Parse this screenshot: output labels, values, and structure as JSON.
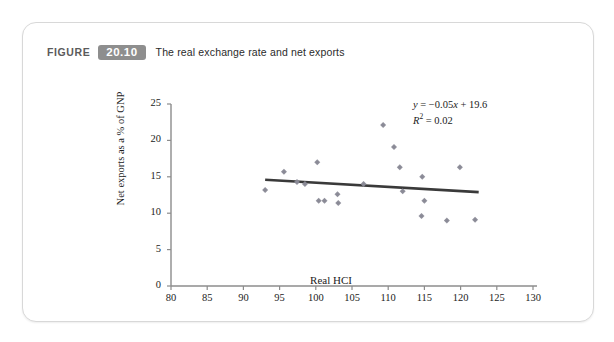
{
  "figure": {
    "label": "FIGURE",
    "number": "20.10",
    "title": "The real exchange rate and net exports",
    "number_badge_color": "#8e8e8e"
  },
  "annotation": {
    "equation_y": "y",
    "equation_eq": " = −0.05",
    "equation_x": "x",
    "equation_tail": " + 19.6",
    "r_squared_label": "R",
    "r_squared_exp": "2",
    "r_squared_value": " = 0.02",
    "full_equation": "y = −0.05x + 19.6",
    "full_r_squared": "R2 = 0.02"
  },
  "chart_data": {
    "type": "scatter",
    "title": "The real exchange rate and net exports",
    "xlabel": "Real HCI",
    "ylabel": "Net exports as a % of GNP",
    "xlim": [
      80,
      130
    ],
    "ylim": [
      0,
      25
    ],
    "xticks": [
      80,
      85,
      90,
      95,
      100,
      105,
      110,
      115,
      120,
      125,
      130
    ],
    "yticks": [
      0,
      5,
      10,
      15,
      20,
      25
    ],
    "grid": false,
    "legend": null,
    "marker_color": "#8a8a96",
    "trendline_color": "#3a3a3a",
    "axis_color": "#8c8c8c",
    "points": [
      {
        "x": 93.0,
        "y": 13.2
      },
      {
        "x": 95.6,
        "y": 15.7
      },
      {
        "x": 97.4,
        "y": 14.3
      },
      {
        "x": 98.5,
        "y": 14.0
      },
      {
        "x": 100.2,
        "y": 17.0
      },
      {
        "x": 100.4,
        "y": 11.7
      },
      {
        "x": 101.2,
        "y": 11.7
      },
      {
        "x": 103.0,
        "y": 12.6
      },
      {
        "x": 103.1,
        "y": 11.4
      },
      {
        "x": 109.3,
        "y": 22.1
      },
      {
        "x": 110.8,
        "y": 19.1
      },
      {
        "x": 111.6,
        "y": 16.3
      },
      {
        "x": 114.7,
        "y": 15.0
      },
      {
        "x": 115.0,
        "y": 11.7
      },
      {
        "x": 114.6,
        "y": 9.6
      },
      {
        "x": 119.9,
        "y": 16.3
      },
      {
        "x": 118.1,
        "y": 9.0
      },
      {
        "x": 122.0,
        "y": 9.1
      },
      {
        "x": 106.6,
        "y": 14.0
      },
      {
        "x": 112.0,
        "y": 13.0
      }
    ],
    "trendline": {
      "slope": -0.05,
      "intercept": 19.6,
      "x_start": 93.0,
      "x_end": 122.5,
      "y_start": 14.6,
      "y_end": 12.9
    }
  }
}
